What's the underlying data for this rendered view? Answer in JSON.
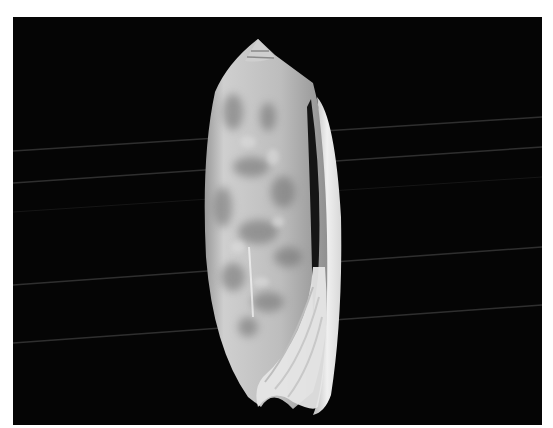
{
  "image": {
    "subject": "olive sea shell (aperture view) on black background",
    "background_color": "#050505",
    "frame_color": "#ffffff",
    "shell_base_color": "#c9c9c9",
    "shell_pattern_color": "#8a8a8a",
    "lip_color": "#e8e8e8",
    "line_color": "#3a3a3a"
  }
}
